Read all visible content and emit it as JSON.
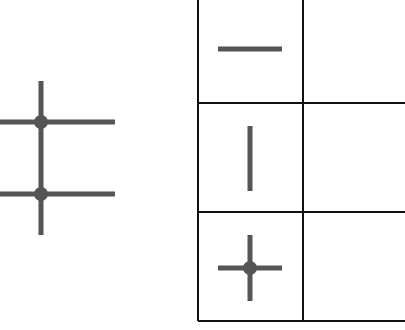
{
  "colors": {
    "background": "#ffffff",
    "symbol": "#555555",
    "grid": "#111111"
  },
  "left_diagram": {
    "description": "vertical line crossing two horizontal lines with junction dots",
    "vertical": {
      "x": 41,
      "y1": 81,
      "y2": 235
    },
    "horizontals": [
      {
        "y": 122,
        "x1": 0,
        "x2": 115
      },
      {
        "y": 194,
        "x1": 0,
        "x2": 115
      }
    ],
    "junctions": [
      {
        "x": 41,
        "y": 122
      },
      {
        "x": 41,
        "y": 194
      }
    ]
  },
  "legend_table": {
    "rows": [
      {
        "symbol": "horizontal-line-icon",
        "label": ""
      },
      {
        "symbol": "vertical-line-icon",
        "label": ""
      },
      {
        "symbol": "junction-cross-icon",
        "label": ""
      }
    ]
  }
}
